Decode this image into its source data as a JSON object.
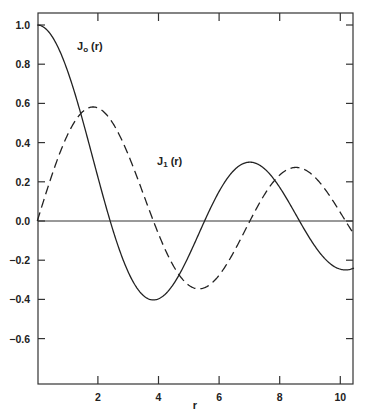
{
  "chart_data": {
    "type": "line",
    "title": "",
    "xlabel": "r",
    "ylabel": "",
    "xlim": [
      0,
      10.45
    ],
    "ylim": [
      -0.83,
      1.05
    ],
    "grid": false,
    "legend": "inline labels",
    "x_ticks": [
      2,
      4,
      6,
      8,
      10
    ],
    "x_tick_labels": [
      "2",
      "4",
      "6",
      "8",
      "10"
    ],
    "y_ticks": [
      1.0,
      0.8,
      0.6,
      0.4,
      0.2,
      0.0,
      -0.2,
      -0.4,
      -0.6
    ],
    "y_tick_labels": [
      "1.0",
      "0.8",
      "0.6",
      "0.4",
      "0.2",
      "0.0",
      "−0.2",
      "−0.4",
      "−0.6"
    ],
    "series": [
      {
        "name": "J₀ (r)",
        "label_main": "J",
        "label_sub": "o",
        "label_rest": " (r)",
        "style": "solid",
        "function": "besselJ0",
        "x": [
          0,
          1,
          2,
          2.405,
          3,
          3.832,
          4,
          5,
          5.52,
          6,
          7,
          7.016,
          8,
          8.654,
          9,
          10,
          10.173,
          10.45
        ],
        "values": [
          1.0,
          0.765,
          0.224,
          0.0,
          -0.26,
          -0.403,
          -0.397,
          -0.178,
          0.0,
          0.151,
          0.3,
          0.3,
          0.172,
          0.0,
          -0.09,
          -0.246,
          -0.25,
          -0.24
        ]
      },
      {
        "name": "J₁ (r)",
        "label_main": "J",
        "label_sub": "1",
        "label_rest": " (r)",
        "style": "dashed",
        "function": "besselJ1",
        "x": [
          0,
          1,
          1.841,
          2,
          3,
          3.832,
          4,
          5,
          5.331,
          6,
          7,
          7.016,
          8,
          8.536,
          9,
          10,
          10.45
        ],
        "values": [
          0.0,
          0.44,
          0.582,
          0.577,
          0.339,
          0.0,
          -0.066,
          -0.328,
          -0.346,
          -0.277,
          -0.005,
          0.0,
          0.235,
          0.273,
          0.245,
          0.043,
          -0.082
        ]
      }
    ],
    "annotations": [
      "zero baseline at y = 0"
    ]
  }
}
